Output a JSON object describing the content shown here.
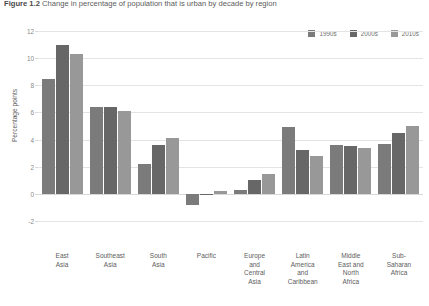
{
  "figure": {
    "number": "Figure 1.2",
    "title": "Change in percentage of population that is urban by decade by region"
  },
  "chart_data": {
    "type": "bar",
    "title": "Change in percentage of population that is urban by decade by region",
    "xlabel": "",
    "ylabel": "Percentage points",
    "ylim": [
      -2,
      12
    ],
    "yticks": [
      12,
      10,
      8,
      6,
      4,
      2,
      0,
      -2
    ],
    "grid": true,
    "legend_position": "top-right",
    "categories": [
      "East\nAsia",
      "Southeast\nAsia",
      "South\nAsia",
      "Pacific",
      "Europe\nand\nCentral\nAsia",
      "Latin\nAmerica\nand\nCaribbean",
      "Middle\nEast and\nNorth\nAfrica",
      "Sub-\nSaharan\nAfrica"
    ],
    "series": [
      {
        "name": "1990s",
        "color": "#7b7b7b",
        "values": [
          8.5,
          6.4,
          2.2,
          -0.8,
          0.3,
          4.9,
          3.6,
          3.7
        ]
      },
      {
        "name": "2000s",
        "color": "#676767",
        "values": [
          11.0,
          6.4,
          3.6,
          -0.1,
          1.0,
          3.2,
          3.5,
          4.5
        ]
      },
      {
        "name": "2010s",
        "color": "#989898",
        "values": [
          10.3,
          6.1,
          4.1,
          0.2,
          1.5,
          2.8,
          3.4,
          5.0
        ]
      }
    ]
  },
  "colors": {
    "grid": "#e4e4e4",
    "axis_text": "#8a8a8a",
    "label_text": "#5d5d5d",
    "title_text": "#5b5b5b",
    "background": "#ffffff"
  }
}
